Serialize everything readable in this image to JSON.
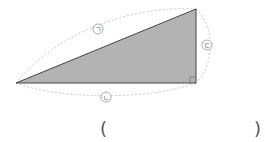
{
  "diagram": {
    "type": "right-triangle",
    "vertices": {
      "left": [
        16,
        83
      ],
      "top_right": [
        196,
        9
      ],
      "bottom_right": [
        196,
        83
      ]
    },
    "right_angle_at": "bottom_right",
    "fill_color": "#b3b3b3",
    "stroke_color": "#444444",
    "arc_color": "#bbbbbb",
    "labels": {
      "hypotenuse": "ㄱ",
      "base": "ㄴ",
      "height": "ㄷ"
    }
  },
  "answer": {
    "open_paren": "(",
    "close_paren": ")",
    "value": ""
  }
}
